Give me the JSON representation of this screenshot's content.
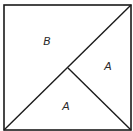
{
  "diagram": {
    "type": "square-partition",
    "stroke_color": "#1a1a1a",
    "square": {
      "x1": 4,
      "y1": 5,
      "x2": 131,
      "y2": 130
    },
    "diagonal": {
      "from": [
        4,
        130
      ],
      "to": [
        131,
        5
      ]
    },
    "inner_segment": {
      "from": [
        68,
        68
      ],
      "to": [
        131,
        130
      ]
    },
    "regions": [
      {
        "id": "upper-left",
        "label": "B",
        "x": 47,
        "y": 45
      },
      {
        "id": "right",
        "label": "A",
        "x": 108,
        "y": 70
      },
      {
        "id": "bottom",
        "label": "A",
        "x": 66,
        "y": 110
      }
    ]
  }
}
